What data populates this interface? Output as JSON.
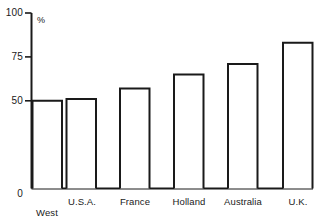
{
  "chart_data": {
    "type": "bar",
    "title": "",
    "subtitle": "",
    "xlabel": "",
    "ylabel": "%",
    "categories": [
      "West\nGermany",
      "U.S.A.",
      "France",
      "Holland",
      "Australia",
      "U.K."
    ],
    "values": [
      50,
      51,
      57,
      65,
      71,
      83
    ],
    "ylim": [
      0,
      100
    ],
    "yticks": [
      0,
      50,
      75,
      100
    ],
    "ytick_labels": [
      "0",
      "50",
      "75",
      "100"
    ],
    "grid": false,
    "legend": null,
    "bar_style": "outline",
    "annotations": []
  },
  "axis": {
    "unit_symbol": "%",
    "tick_0": "0",
    "tick_50": "50",
    "tick_75": "75",
    "tick_100": "100"
  },
  "categories_display": {
    "c0_line1": "West",
    "c0_line2": "Germany",
    "c1": "U.S.A.",
    "c2": "France",
    "c3": "Holland",
    "c4": "Australia",
    "c5": "U.K."
  },
  "colors": {
    "ink": "#1a1a1a",
    "background": "#ffffff",
    "bar_fill": "#ffffff",
    "bar_stroke": "#1a1a1a"
  }
}
